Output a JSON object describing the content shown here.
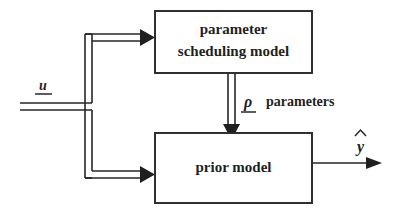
{
  "diagram": {
    "background_color": "#ffffff",
    "line_color": "#262626",
    "text_color": "#1f1f1f",
    "blocks": [
      {
        "id": "parameter-scheduling-model",
        "label_line1": "parameter",
        "label_line2": "scheduling model",
        "x": 155,
        "y": 11,
        "width": 157,
        "height": 62
      },
      {
        "id": "prior-model",
        "label_line1": "prior model",
        "label_line2": "",
        "x": 155,
        "y": 133,
        "width": 157,
        "height": 70
      }
    ],
    "signals": [
      {
        "id": "input-u",
        "label": "u",
        "style": "italic-underlined",
        "type": "bus",
        "description": "input signal entering from left, splits to both blocks"
      },
      {
        "id": "rho-parameters",
        "symbol": "ρ",
        "label": "parameters",
        "style": "italic-underlined",
        "type": "bus",
        "description": "scheduled parameters from scheduling model to prior model"
      },
      {
        "id": "output-yhat",
        "label": "y",
        "accent": "hat",
        "style": "italic-hat",
        "type": "single",
        "description": "model output leaving prior model to the right"
      }
    ]
  }
}
